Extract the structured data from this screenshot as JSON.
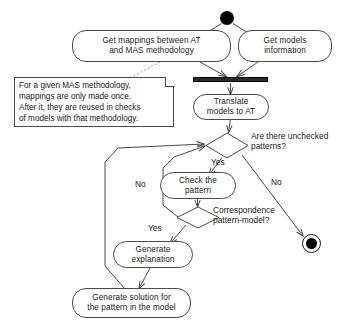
{
  "diagram": {
    "type": "uml-activity-diagram",
    "title": "",
    "start_state": {
      "name": "initial-state",
      "shape": "filled-circle"
    },
    "end_state": {
      "name": "final-state",
      "shape": "bullseye-circle"
    },
    "sync_bar": {
      "name": "fork-join-bar",
      "label": ""
    },
    "activities": [
      {
        "id": "get_mappings",
        "label": "Get mappings between AT\nand MAS methodology"
      },
      {
        "id": "get_models",
        "label": "Get models\ninformation"
      },
      {
        "id": "translate",
        "label": "Translate\nmodels to AT"
      },
      {
        "id": "check_pattern",
        "label": "Check the\npattern"
      },
      {
        "id": "generate_explanation",
        "label": "Generate\nexplanation"
      },
      {
        "id": "generate_solution",
        "label": "Generate solution for\nthe pattern in the model"
      }
    ],
    "decisions": [
      {
        "id": "unchecked_patterns",
        "label": "Are there unchecked\npatterns?"
      },
      {
        "id": "correspondence",
        "label": "Correspondence\npattern-model?"
      }
    ],
    "edge_labels": {
      "unchecked_yes": "Yes",
      "unchecked_no": "No",
      "correspondence_no": "No",
      "correspondence_yes": "Yes"
    },
    "note": {
      "id": "mapping-note",
      "text": "For a given MAS methodology,\nmappings are only made once.\nAfter it, they are reused in checks\nof models with that methodology."
    },
    "colors": {
      "stroke": "#4a4a4a",
      "fill": "#ffffff",
      "text": "#1a1a1a",
      "bar": "#2b2b2b"
    }
  }
}
